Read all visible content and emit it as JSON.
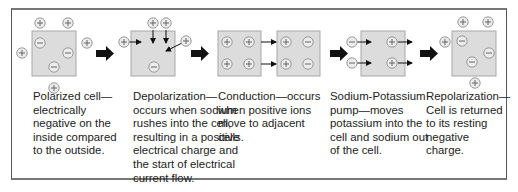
{
  "colors": {
    "cell_fill": "#dcdcdc",
    "cell_border": "#a8a8a8",
    "ion_fill": "#ececec",
    "ion_border": "#999999",
    "arrow": "#111111"
  },
  "ion_symbols": {
    "positive": "+",
    "negative": "−"
  },
  "stages": [
    {
      "name": "polarized-cell",
      "caption": "Polarized cell—\nelectrically\nnegative on the\ninside compared\nto the outside.",
      "inside_ions": [
        "negative",
        "negative",
        "negative"
      ],
      "outside_ions": [
        "positive",
        "positive",
        "positive",
        "positive"
      ]
    },
    {
      "name": "depolarization",
      "caption": "Depolarization—\noccurs when sodium\nrushes into the cell,\nresulting in a positive\nelectrical charge and\nthe start of electrical\ncurrent flow.",
      "inside_ions": [
        "negative"
      ],
      "outside_ions": [
        "positive",
        "positive",
        "positive",
        "positive"
      ]
    },
    {
      "name": "conduction",
      "caption": "Conduction—occurs\nwhen positive ions\nmove to adjacent\ncells.",
      "inside_ions": [
        "positive",
        "positive",
        "positive",
        "positive"
      ],
      "adjacent_cell_ions": [
        "positive",
        "negative",
        "positive",
        "negative"
      ]
    },
    {
      "name": "sodium-potassium-pump",
      "caption": "Sodium-Potassium\npump—moves\npotassium into the\ncell and sodium out\nof the cell.",
      "inside_ions": [
        "positive",
        "positive"
      ],
      "outside_ions": [
        "negative",
        "negative"
      ]
    },
    {
      "name": "repolarization",
      "caption": "Repolarization—\nCell is returned\nto its resting\nnegative\ncharge.",
      "inside_ions": [
        "negative",
        "negative",
        "negative"
      ],
      "outside_ions": [
        "positive",
        "positive",
        "positive",
        "positive"
      ]
    }
  ]
}
